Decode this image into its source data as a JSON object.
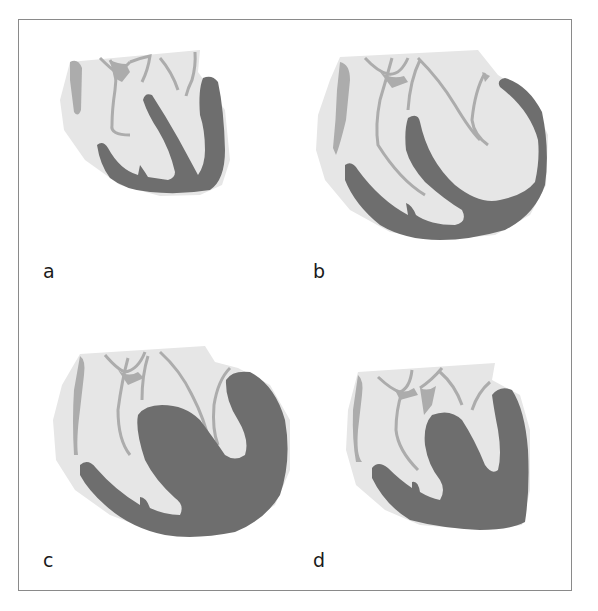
{
  "figure": {
    "panels": [
      {
        "id": "a",
        "label": "a",
        "description": "normal heart"
      },
      {
        "id": "b",
        "label": "b",
        "description": "eccentric hypertrophy / dilated ventricle"
      },
      {
        "id": "c",
        "label": "c",
        "description": "concentric hypertrophy with dilation"
      },
      {
        "id": "d",
        "label": "d",
        "description": "concentric hypertrophy"
      }
    ],
    "colors": {
      "background": "#ffffff",
      "frame": "#8a8a8a",
      "pericardium": "#e6e6e6",
      "chamber": "#ededed",
      "vessel": "#acacac",
      "myocardium": "#6e6e6e",
      "label": "#1a1a1a"
    }
  }
}
